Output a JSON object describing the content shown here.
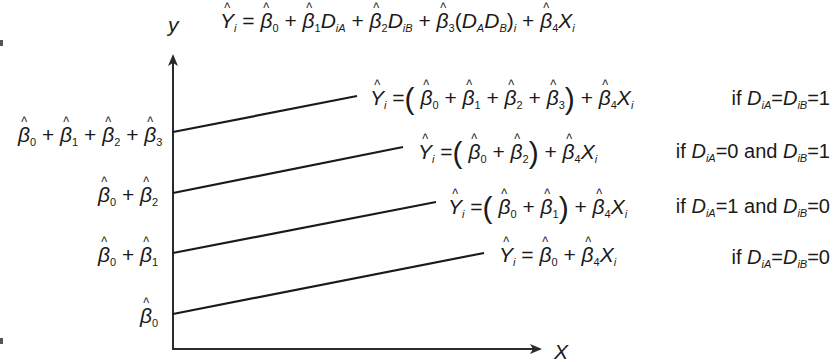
{
  "figure": {
    "type": "regression-lines-with-dummy-interaction",
    "y_axis_label": "y",
    "x_axis_label": "X",
    "model_equation": {
      "lhs": "Ŷ_i",
      "rhs": "β̂0 + β̂1·D_iA + β̂2·D_iB + β̂3·(D_A·D_B)_i + β̂4·X_i",
      "text": "Ŷi = β̂0 + β̂1 DiA + β̂2 DiB + β̂3 (DA DB)i + β̂4 Xi"
    },
    "intercept_labels": [
      {
        "id": "both",
        "text": "β̂0 + β̂1 + β̂2 + β̂3"
      },
      {
        "id": "b_only",
        "text": "β̂0 + β̂2"
      },
      {
        "id": "a_only",
        "text": "β̂0 + β̂1"
      },
      {
        "id": "none",
        "text": "β̂0"
      }
    ],
    "lines": [
      {
        "id": "both",
        "equation": "Ŷi = (β̂0 + β̂1 + β̂2 + β̂3) + β̂4 Xi",
        "condition": "if DiA = DiB = 1",
        "start": [
          173,
          132
        ],
        "end": [
          357,
          96
        ]
      },
      {
        "id": "b_only",
        "equation": "Ŷi = (β̂0 + β̂2) + β̂4 Xi",
        "condition": "if DiA = 0 and DiB = 1",
        "start": [
          173,
          193
        ],
        "end": [
          403,
          147
        ]
      },
      {
        "id": "a_only",
        "equation": "Ŷi = (β̂0 + β̂1) + β̂4 Xi",
        "condition": "if DiA = 1 and DiB = 0",
        "start": [
          173,
          253
        ],
        "end": [
          436,
          202
        ]
      },
      {
        "id": "none",
        "equation": "Ŷi = β̂0 + β̂4 Xi",
        "condition": "if DiA = DiB = 0",
        "start": [
          173,
          314
        ],
        "end": [
          484,
          253
        ]
      }
    ],
    "conditions": {
      "c1": {
        "prefix": "if",
        "rest_a": "=",
        "rest_b": "=1"
      },
      "c2": {
        "prefix": "if",
        "mid_a": "=0 and",
        "rest_b": "=1"
      },
      "c3": {
        "prefix": "if",
        "mid_a": "=1 and",
        "rest_b": "=0"
      },
      "c4": {
        "prefix": "if",
        "rest_a": "=",
        "rest_b": "=0"
      }
    },
    "symbols": {
      "Y": "Y",
      "beta": "β",
      "D": "D",
      "X": "X",
      "i": "i",
      "iA": "iA",
      "iB": "iB",
      "A": "A",
      "B": "B",
      "eq": "=",
      "plus": "+",
      "lp": "(",
      "rp": ")",
      "n0": "0",
      "n1": "1",
      "n2": "2",
      "n3": "3",
      "n4": "4"
    },
    "colors": {
      "line": "#1a1a1a",
      "axis": "#2a2a2a",
      "background": "#ffffff"
    }
  }
}
